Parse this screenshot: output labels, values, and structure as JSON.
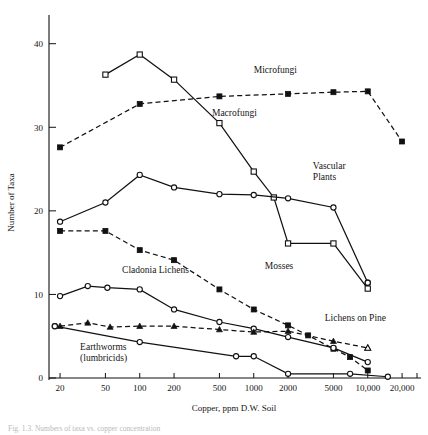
{
  "figure": {
    "caption": "Fig. 1.3.  Numbers of taxa vs. copper concentration",
    "xlabel": "Copper, ppm D.W. Soil",
    "ylabel": "Number of Taxa"
  },
  "chart_data": {
    "type": "line",
    "title": "",
    "xlabel": "Copper, ppm D.W. Soil",
    "ylabel": "Number of Taxa",
    "xscale": "log",
    "xlim": [
      16,
      23000
    ],
    "ylim": [
      0,
      42
    ],
    "grid": false,
    "legend": "inline-annotations",
    "xticks": [
      20,
      50,
      100,
      200,
      500,
      1000,
      2000,
      5000,
      10000,
      20000
    ],
    "xticklabels": [
      "20",
      "50",
      "100",
      "200",
      "500",
      "1000",
      "2000",
      "5000",
      "10,000",
      "20,000"
    ],
    "yticks": [
      0,
      10,
      20,
      30,
      40
    ],
    "yticklabels": [
      "0",
      "10",
      "20",
      "30",
      "40"
    ],
    "series": [
      {
        "name": "Microfungi",
        "marker": "filled-square",
        "line": "dashed",
        "label_x": 1000,
        "label_y": 36.5,
        "points": [
          {
            "x": 20,
            "y": 27.6
          },
          {
            "x": 100,
            "y": 32.8
          },
          {
            "x": 500,
            "y": 33.7
          },
          {
            "x": 2000,
            "y": 34.0
          },
          {
            "x": 5000,
            "y": 34.2
          },
          {
            "x": 10000,
            "y": 34.3
          },
          {
            "x": 20000,
            "y": 28.3
          }
        ]
      },
      {
        "name": "Macrofungi",
        "marker": "open-square",
        "line": "solid",
        "label_x": 430,
        "label_y": 31.3,
        "points": [
          {
            "x": 50,
            "y": 36.3
          },
          {
            "x": 100,
            "y": 38.7
          },
          {
            "x": 200,
            "y": 35.7
          },
          {
            "x": 500,
            "y": 30.5
          },
          {
            "x": 1000,
            "y": 24.7
          },
          {
            "x": 1500,
            "y": 21.6
          },
          {
            "x": 2000,
            "y": 16.1
          },
          {
            "x": 5000,
            "y": 16.1
          },
          {
            "x": 10000,
            "y": 10.7
          }
        ]
      },
      {
        "name": "Vascular Plants",
        "marker": "open-circle",
        "line": "solid",
        "label_x": 3300,
        "label_y": 25.0,
        "points": [
          {
            "x": 20,
            "y": 18.7
          },
          {
            "x": 50,
            "y": 21.0
          },
          {
            "x": 100,
            "y": 24.3
          },
          {
            "x": 200,
            "y": 22.8
          },
          {
            "x": 500,
            "y": 22.0
          },
          {
            "x": 1000,
            "y": 21.9
          },
          {
            "x": 2000,
            "y": 21.5
          },
          {
            "x": 5000,
            "y": 20.4
          },
          {
            "x": 10000,
            "y": 11.4
          }
        ]
      },
      {
        "name": "Mosses",
        "marker": "filled-square",
        "line": "dashed",
        "label_x": 1250,
        "label_y": 13.0,
        "points": [
          {
            "x": 20,
            "y": 17.6
          },
          {
            "x": 50,
            "y": 17.6
          },
          {
            "x": 100,
            "y": 15.3
          },
          {
            "x": 200,
            "y": 14.1
          },
          {
            "x": 500,
            "y": 10.6
          },
          {
            "x": 1000,
            "y": 8.2
          },
          {
            "x": 2000,
            "y": 6.3
          },
          {
            "x": 3000,
            "y": 5.1
          },
          {
            "x": 5000,
            "y": 3.5
          },
          {
            "x": 7000,
            "y": 2.5
          },
          {
            "x": 10000,
            "y": 0.9
          }
        ]
      },
      {
        "name": "Cladonia Lichens",
        "marker": "open-circle",
        "line": "solid",
        "label_x": 70,
        "label_y": 12.6,
        "points": [
          {
            "x": 20,
            "y": 9.8
          },
          {
            "x": 35,
            "y": 11.0
          },
          {
            "x": 52,
            "y": 10.8
          },
          {
            "x": 100,
            "y": 10.6
          },
          {
            "x": 200,
            "y": 8.2
          },
          {
            "x": 500,
            "y": 6.7
          },
          {
            "x": 1000,
            "y": 5.9
          },
          {
            "x": 2000,
            "y": 4.9
          },
          {
            "x": 5000,
            "y": 3.6
          },
          {
            "x": 10000,
            "y": 1.9
          }
        ]
      },
      {
        "name": "Lichens on Pine",
        "marker": "filled-triangle",
        "line": "dashed",
        "label_x": 4200,
        "label_y": 6.8,
        "points": [
          {
            "x": 20,
            "y": 6.2
          },
          {
            "x": 35,
            "y": 6.6
          },
          {
            "x": 55,
            "y": 6.1
          },
          {
            "x": 100,
            "y": 6.2
          },
          {
            "x": 200,
            "y": 6.2
          },
          {
            "x": 500,
            "y": 5.8
          },
          {
            "x": 1000,
            "y": 5.5
          },
          {
            "x": 2000,
            "y": 5.6
          },
          {
            "x": 5000,
            "y": 4.4
          },
          {
            "x": 10000,
            "y": 3.6
          }
        ]
      },
      {
        "name": "Earthworms (lumbricids)",
        "marker": "open-circle",
        "line": "solid",
        "label_x": 30,
        "label_y": 3.4,
        "points": [
          {
            "x": 18,
            "y": 6.2
          },
          {
            "x": 100,
            "y": 4.3
          },
          {
            "x": 700,
            "y": 2.6
          },
          {
            "x": 1000,
            "y": 2.6
          },
          {
            "x": 2000,
            "y": 0.5
          },
          {
            "x": 7000,
            "y": 0.5
          },
          {
            "x": 15000,
            "y": 0.15
          }
        ]
      }
    ],
    "extra_markers": [
      {
        "series": "Cladonia Lichens",
        "x": 18,
        "y": 6.2,
        "marker": "open-circle"
      },
      {
        "series": "Macrofungi",
        "x": 10000,
        "y": 11.4,
        "marker": "open-circle"
      }
    ]
  }
}
